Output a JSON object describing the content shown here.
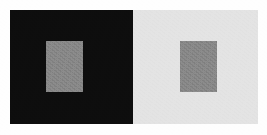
{
  "figure": {
    "name": "Simultaneous Contrast Illusion",
    "canvas_width": 267,
    "canvas_height": 135,
    "margin_color": "#fefefe"
  },
  "panels": [
    {
      "id": "dark",
      "label": "Dark surround panel",
      "color": "#0d0d0d",
      "x": 10,
      "y": 10,
      "width": 123,
      "height": 114
    },
    {
      "id": "light",
      "label": "Light surround panel",
      "color": "#e3e3e3",
      "x": 133,
      "y": 10,
      "width": 125,
      "height": 114
    }
  ],
  "patches": [
    {
      "id": "patch-on-dark",
      "label": "Gray test patch on dark surround",
      "color": "#858585",
      "x": 46,
      "y": 41,
      "width": 37,
      "height": 51
    },
    {
      "id": "patch-on-light",
      "label": "Gray test patch on light surround",
      "color": "#858585",
      "x": 180,
      "y": 41,
      "width": 37,
      "height": 51
    }
  ]
}
